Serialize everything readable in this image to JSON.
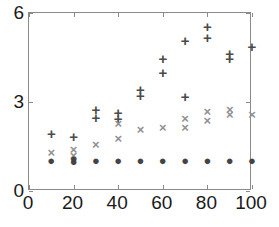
{
  "chart_data": {
    "type": "scatter",
    "title": "",
    "subtitle": "",
    "xlabel": "",
    "ylabel": "",
    "xlim": [
      0,
      100
    ],
    "ylim": [
      0,
      6
    ],
    "xticks": [
      0,
      20,
      40,
      60,
      80,
      100
    ],
    "yticks": [
      0,
      3,
      6
    ],
    "xtick_labels": [
      "0",
      "20",
      "40",
      "60",
      "80",
      "100"
    ],
    "ytick_labels": [
      "0",
      "3",
      "6"
    ],
    "grid": false,
    "legend": null,
    "legend_position": "none",
    "x": [
      10,
      20,
      30,
      40,
      50,
      60,
      70,
      80,
      90,
      100
    ],
    "series": [
      {
        "name": "plus-series",
        "marker": "+",
        "color": "#4a4a4a",
        "values": [
          1.95,
          1.85,
          2.62,
          2.55,
          3.35,
          4.25,
          4.15,
          5.38,
          4.58,
          4.9
        ],
        "points": [
          {
            "x": 10,
            "y": 1.95
          },
          {
            "x": 20,
            "y": 1.85
          },
          {
            "x": 30,
            "y": 2.5
          },
          {
            "x": 30,
            "y": 2.75
          },
          {
            "x": 40,
            "y": 2.45
          },
          {
            "x": 40,
            "y": 2.65
          },
          {
            "x": 50,
            "y": 3.25
          },
          {
            "x": 50,
            "y": 3.45
          },
          {
            "x": 60,
            "y": 4.0
          },
          {
            "x": 60,
            "y": 4.5
          },
          {
            "x": 70,
            "y": 3.2
          },
          {
            "x": 70,
            "y": 5.1
          },
          {
            "x": 80,
            "y": 5.2
          },
          {
            "x": 80,
            "y": 5.55
          },
          {
            "x": 90,
            "y": 4.5
          },
          {
            "x": 90,
            "y": 4.65
          },
          {
            "x": 100,
            "y": 4.9
          }
        ]
      },
      {
        "name": "cross-series",
        "marker": "x",
        "color": "#909090",
        "values": [
          1.3,
          1.3,
          1.6,
          2.05,
          2.1,
          2.15,
          2.3,
          2.55,
          2.68,
          2.6
        ],
        "points": [
          {
            "x": 10,
            "y": 1.3
          },
          {
            "x": 20,
            "y": 1.2
          },
          {
            "x": 20,
            "y": 1.4
          },
          {
            "x": 30,
            "y": 1.6
          },
          {
            "x": 40,
            "y": 1.8
          },
          {
            "x": 40,
            "y": 2.3
          },
          {
            "x": 50,
            "y": 2.1
          },
          {
            "x": 60,
            "y": 2.15
          },
          {
            "x": 70,
            "y": 2.15
          },
          {
            "x": 70,
            "y": 2.45
          },
          {
            "x": 80,
            "y": 2.4
          },
          {
            "x": 80,
            "y": 2.7
          },
          {
            "x": 90,
            "y": 2.6
          },
          {
            "x": 90,
            "y": 2.75
          },
          {
            "x": 100,
            "y": 2.6
          }
        ]
      },
      {
        "name": "circle-series",
        "marker": "o",
        "color": "#444444",
        "values": [
          1.05,
          1.05,
          1.05,
          1.05,
          1.05,
          1.05,
          1.05,
          1.05,
          1.05,
          1.05
        ],
        "points": [
          {
            "x": 10,
            "y": 1.05
          },
          {
            "x": 20,
            "y": 1.0
          },
          {
            "x": 20,
            "y": 1.12
          },
          {
            "x": 30,
            "y": 1.05
          },
          {
            "x": 40,
            "y": 1.05
          },
          {
            "x": 50,
            "y": 1.05
          },
          {
            "x": 60,
            "y": 1.05
          },
          {
            "x": 70,
            "y": 1.05
          },
          {
            "x": 80,
            "y": 1.05
          },
          {
            "x": 90,
            "y": 1.05
          },
          {
            "x": 100,
            "y": 1.05
          }
        ]
      }
    ],
    "marker_glyphs": {
      "+": "+",
      "x": "×",
      "o": "●"
    }
  },
  "axes": {
    "frame_color": "#8a8a8a",
    "label_color": "#1a1a1a"
  }
}
